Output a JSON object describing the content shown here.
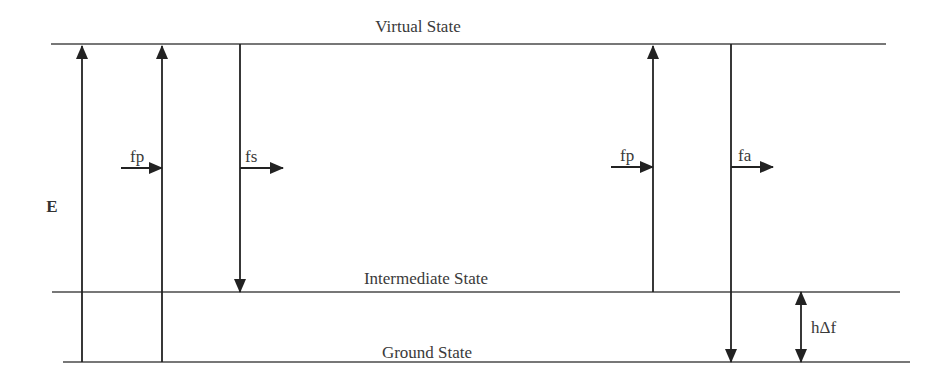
{
  "diagram": {
    "type": "energy-level-diagram",
    "axis_label": "E",
    "levels": [
      {
        "id": "virtual",
        "label": "Virtual State"
      },
      {
        "id": "intermediate",
        "label": "Intermediate State"
      },
      {
        "id": "ground",
        "label": "Ground State"
      }
    ],
    "transitions": [
      {
        "id": "t1",
        "from": "ground",
        "to": "virtual",
        "direction": "up"
      },
      {
        "id": "t2",
        "from": "ground",
        "to": "virtual",
        "direction": "up",
        "label": "fp"
      },
      {
        "id": "t3",
        "from": "virtual",
        "to": "intermediate",
        "direction": "down",
        "label": "fs"
      },
      {
        "id": "t4",
        "from": "intermediate",
        "to": "virtual",
        "direction": "up",
        "label": "fp"
      },
      {
        "id": "t5",
        "from": "virtual",
        "to": "ground",
        "direction": "down",
        "label": "fa"
      }
    ],
    "gap": {
      "between": [
        "intermediate",
        "ground"
      ],
      "label": "hΔf"
    },
    "photon_labels": {
      "pump_left": "fp",
      "stokes": "fs",
      "pump_right": "fp",
      "antistokes": "fa"
    }
  }
}
